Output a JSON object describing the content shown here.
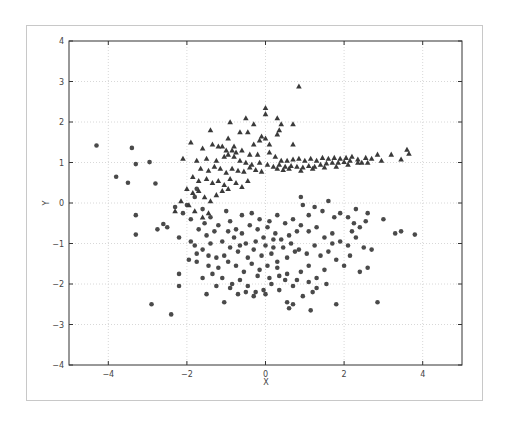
{
  "chart_data": {
    "type": "scatter",
    "title": "",
    "xlabel": "X",
    "ylabel": "Y",
    "xlim": [
      -5,
      5
    ],
    "ylim": [
      -4,
      4
    ],
    "xticks": [
      -4,
      -2,
      0,
      2,
      4
    ],
    "yticks": [
      -4,
      -3,
      -2,
      -1,
      0,
      1,
      2,
      3,
      4
    ],
    "grid": true,
    "legend": null,
    "colors": {
      "points": "#4a4a4a",
      "grid": "#d8d8d8",
      "axes": "#333333"
    },
    "series": [
      {
        "name": "class-circle",
        "marker": "circle",
        "points": [
          [
            -4.3,
            1.42
          ],
          [
            -3.4,
            1.36
          ],
          [
            -3.3,
            0.96
          ],
          [
            -2.95,
            1.01
          ],
          [
            -3.8,
            0.65
          ],
          [
            -3.5,
            0.5
          ],
          [
            -2.8,
            0.48
          ],
          [
            -3.3,
            -0.3
          ],
          [
            -3.3,
            -0.78
          ],
          [
            -2.6,
            -0.52
          ],
          [
            -2.5,
            -0.6
          ],
          [
            -2.2,
            -0.85
          ],
          [
            -2.75,
            -0.65
          ],
          [
            -2.2,
            -1.75
          ],
          [
            -2.2,
            -2.05
          ],
          [
            -2.9,
            -2.5
          ],
          [
            -2.4,
            -2.75
          ],
          [
            -1.5,
            -2.25
          ],
          [
            -1.05,
            -2.45
          ],
          [
            -2.3,
            -0.1
          ],
          [
            -2.1,
            -0.25
          ],
          [
            -2.0,
            -0.05
          ],
          [
            -1.8,
            0.15
          ],
          [
            -1.75,
            0.35
          ],
          [
            -1.6,
            -0.15
          ],
          [
            -1.4,
            -0.35
          ],
          [
            -1.9,
            -0.4
          ],
          [
            -1.7,
            -0.65
          ],
          [
            -1.55,
            -0.5
          ],
          [
            -1.3,
            -0.7
          ],
          [
            -1.2,
            -0.55
          ],
          [
            -1.0,
            -0.2
          ],
          [
            -0.9,
            -0.45
          ],
          [
            -0.75,
            -0.65
          ],
          [
            -0.6,
            -0.75
          ],
          [
            -0.4,
            -0.55
          ],
          [
            -0.2,
            -0.65
          ],
          [
            -0.05,
            -0.85
          ],
          [
            0.1,
            -0.45
          ],
          [
            -1.9,
            -0.95
          ],
          [
            -1.8,
            -1.05
          ],
          [
            -1.6,
            -1.15
          ],
          [
            -1.4,
            -1.0
          ],
          [
            -1.1,
            -0.95
          ],
          [
            -0.9,
            -1.1
          ],
          [
            -0.7,
            -1.2
          ],
          [
            -0.5,
            -1.0
          ],
          [
            -0.3,
            -1.15
          ],
          [
            -0.1,
            -1.3
          ],
          [
            0.2,
            -1.1
          ],
          [
            0.4,
            -0.9
          ],
          [
            0.6,
            -0.8
          ],
          [
            0.8,
            -0.7
          ],
          [
            -1.95,
            -1.4
          ],
          [
            -1.75,
            -1.45
          ],
          [
            -1.45,
            -1.55
          ],
          [
            -1.2,
            -1.6
          ],
          [
            -0.95,
            -1.45
          ],
          [
            -0.75,
            -1.55
          ],
          [
            -0.55,
            -1.7
          ],
          [
            -0.35,
            -1.5
          ],
          [
            -0.15,
            -1.65
          ],
          [
            0.05,
            -1.55
          ],
          [
            0.3,
            -1.45
          ],
          [
            0.55,
            -1.35
          ],
          [
            0.75,
            -1.2
          ],
          [
            -1.6,
            -1.85
          ],
          [
            -1.35,
            -1.75
          ],
          [
            -1.1,
            -1.85
          ],
          [
            -0.85,
            -2.0
          ],
          [
            -0.65,
            -1.9
          ],
          [
            -0.45,
            -2.05
          ],
          [
            -0.25,
            -2.2
          ],
          [
            -0.05,
            -2.15
          ],
          [
            0.15,
            -2.0
          ],
          [
            0.35,
            -1.8
          ],
          [
            0.55,
            -1.75
          ],
          [
            0.8,
            -1.9
          ],
          [
            -0.7,
            -2.25
          ],
          [
            -0.5,
            -2.2
          ],
          [
            -0.3,
            -2.3
          ],
          [
            0.0,
            -2.25
          ],
          [
            0.55,
            -2.45
          ],
          [
            0.6,
            -2.6
          ],
          [
            0.7,
            -2.5
          ],
          [
            1.15,
            -2.65
          ],
          [
            1.2,
            -2.2
          ],
          [
            1.8,
            -2.5
          ],
          [
            2.85,
            -2.45
          ],
          [
            0.9,
            0.15
          ],
          [
            0.95,
            -0.05
          ],
          [
            1.1,
            -0.3
          ],
          [
            1.25,
            -0.1
          ],
          [
            1.45,
            -0.2
          ],
          [
            1.6,
            0.05
          ],
          [
            1.75,
            -0.35
          ],
          [
            1.9,
            -0.25
          ],
          [
            2.1,
            -0.35
          ],
          [
            2.25,
            -0.5
          ],
          [
            2.4,
            -0.6
          ],
          [
            2.55,
            -0.45
          ],
          [
            2.3,
            -0.15
          ],
          [
            2.6,
            -0.25
          ],
          [
            3.0,
            -0.4
          ],
          [
            3.3,
            -0.75
          ],
          [
            3.45,
            -0.7
          ],
          [
            3.8,
            -0.78
          ],
          [
            0.3,
            -0.3
          ],
          [
            0.5,
            -0.5
          ],
          [
            0.7,
            -0.4
          ],
          [
            0.9,
            -0.55
          ],
          [
            1.1,
            -0.7
          ],
          [
            1.3,
            -0.6
          ],
          [
            1.5,
            -0.85
          ],
          [
            1.7,
            -0.75
          ],
          [
            1.9,
            -0.95
          ],
          [
            2.1,
            -1.05
          ],
          [
            2.3,
            -0.85
          ],
          [
            2.5,
            -1.1
          ],
          [
            2.7,
            -1.15
          ],
          [
            0.2,
            -0.9
          ],
          [
            0.45,
            -1.1
          ],
          [
            0.65,
            -1.0
          ],
          [
            0.85,
            -1.15
          ],
          [
            1.05,
            -1.25
          ],
          [
            1.25,
            -1.05
          ],
          [
            1.4,
            -1.3
          ],
          [
            1.6,
            -1.2
          ],
          [
            1.8,
            -1.4
          ],
          [
            2.0,
            -1.55
          ],
          [
            2.15,
            -1.3
          ],
          [
            2.4,
            -1.7
          ],
          [
            2.6,
            -1.6
          ],
          [
            0.3,
            -1.6
          ],
          [
            0.5,
            -1.9
          ],
          [
            0.7,
            -2.05
          ],
          [
            0.9,
            -1.7
          ],
          [
            1.1,
            -1.55
          ],
          [
            1.3,
            -1.85
          ],
          [
            1.5,
            -1.65
          ],
          [
            1.1,
            -1.95
          ],
          [
            1.3,
            -2.1
          ],
          [
            1.55,
            -2.0
          ],
          [
            0.95,
            -2.3
          ],
          [
            -0.6,
            -0.3
          ],
          [
            -0.35,
            -0.25
          ],
          [
            -0.15,
            -0.4
          ],
          [
            0.05,
            -0.6
          ],
          [
            0.25,
            -0.75
          ],
          [
            -0.8,
            -0.85
          ],
          [
            -1.05,
            -1.3
          ],
          [
            -1.25,
            -1.35
          ],
          [
            -0.45,
            -1.35
          ],
          [
            -0.25,
            -0.95
          ],
          [
            0.0,
            -1.05
          ],
          [
            0.15,
            -1.25
          ],
          [
            -1.5,
            -0.8
          ],
          [
            -1.75,
            -1.25
          ],
          [
            -0.95,
            -0.7
          ],
          [
            -0.65,
            -1.05
          ],
          [
            -0.2,
            -1.8
          ],
          [
            0.1,
            -1.85
          ],
          [
            0.35,
            -2.15
          ],
          [
            -0.9,
            -2.1
          ],
          [
            -1.25,
            -2.05
          ],
          [
            -1.45,
            -1.3
          ],
          [
            1.7,
            -1.0
          ],
          [
            2.2,
            -0.7
          ]
        ]
      },
      {
        "name": "class-triangle",
        "marker": "triangle",
        "points": [
          [
            0.85,
            2.88
          ],
          [
            0.0,
            2.35
          ],
          [
            0.0,
            2.2
          ],
          [
            -0.5,
            2.1
          ],
          [
            0.3,
            2.1
          ],
          [
            0.4,
            1.95
          ],
          [
            -0.9,
            2.0
          ],
          [
            -0.3,
            1.95
          ],
          [
            0.35,
            1.8
          ],
          [
            -1.4,
            1.8
          ],
          [
            -0.65,
            1.75
          ],
          [
            -0.45,
            1.75
          ],
          [
            0.3,
            1.7
          ],
          [
            -0.1,
            1.65
          ],
          [
            0.0,
            1.6
          ],
          [
            -0.15,
            1.55
          ],
          [
            -0.3,
            1.45
          ],
          [
            0.1,
            1.45
          ],
          [
            0.7,
            1.95
          ],
          [
            0.7,
            1.45
          ],
          [
            -1.9,
            1.5
          ],
          [
            -2.1,
            1.1
          ],
          [
            -1.35,
            1.45
          ],
          [
            -1.2,
            1.4
          ],
          [
            -1.6,
            1.35
          ],
          [
            -1.0,
            1.3
          ],
          [
            -0.85,
            1.3
          ],
          [
            -0.75,
            1.25
          ],
          [
            -0.6,
            1.3
          ],
          [
            -0.4,
            1.2
          ],
          [
            -0.2,
            1.2
          ],
          [
            0.1,
            1.25
          ],
          [
            0.25,
            1.15
          ],
          [
            -1.75,
            1.05
          ],
          [
            -1.5,
            1.1
          ],
          [
            -1.25,
            1.05
          ],
          [
            -1.05,
            1.15
          ],
          [
            -0.95,
            1.2
          ],
          [
            -0.8,
            1.15
          ],
          [
            -0.65,
            1.05
          ],
          [
            -0.5,
            1.0
          ],
          [
            -0.35,
            0.95
          ],
          [
            -0.15,
            1.0
          ],
          [
            0.05,
            0.95
          ],
          [
            0.2,
            0.9
          ],
          [
            0.35,
            0.95
          ],
          [
            0.5,
            0.9
          ],
          [
            0.65,
            0.92
          ],
          [
            0.8,
            0.9
          ],
          [
            0.95,
            0.88
          ],
          [
            1.1,
            0.92
          ],
          [
            1.25,
            0.9
          ],
          [
            1.4,
            0.95
          ],
          [
            1.55,
            0.98
          ],
          [
            1.7,
            1.0
          ],
          [
            1.85,
            1.0
          ],
          [
            2.0,
            1.02
          ],
          [
            2.15,
            1.05
          ],
          [
            0.4,
            1.05
          ],
          [
            0.55,
            1.05
          ],
          [
            0.7,
            1.08
          ],
          [
            0.85,
            1.1
          ],
          [
            1.0,
            1.05
          ],
          [
            1.15,
            1.1
          ],
          [
            1.3,
            1.05
          ],
          [
            1.45,
            1.12
          ],
          [
            1.6,
            1.1
          ],
          [
            1.75,
            1.12
          ],
          [
            1.9,
            1.1
          ],
          [
            2.05,
            1.12
          ],
          [
            2.2,
            1.15
          ],
          [
            2.35,
            1.08
          ],
          [
            0.3,
            0.85
          ],
          [
            0.45,
            0.82
          ],
          [
            0.6,
            0.85
          ],
          [
            0.9,
            0.8
          ],
          [
            1.2,
            0.85
          ],
          [
            1.5,
            0.88
          ],
          [
            1.8,
            0.9
          ],
          [
            2.1,
            0.95
          ],
          [
            2.35,
            1.0
          ],
          [
            2.6,
            1.0
          ],
          [
            2.7,
            1.1
          ],
          [
            2.85,
            1.2
          ],
          [
            2.95,
            1.05
          ],
          [
            3.2,
            1.2
          ],
          [
            3.45,
            1.08
          ],
          [
            3.6,
            1.32
          ],
          [
            3.65,
            1.22
          ],
          [
            2.45,
            1.0
          ],
          [
            2.55,
            1.12
          ],
          [
            -1.65,
            0.85
          ],
          [
            -1.45,
            0.8
          ],
          [
            -1.3,
            0.9
          ],
          [
            -1.15,
            0.85
          ],
          [
            -1.0,
            0.75
          ],
          [
            -0.85,
            0.85
          ],
          [
            -0.7,
            0.8
          ],
          [
            -0.55,
            0.78
          ],
          [
            -0.4,
            0.88
          ],
          [
            -0.25,
            0.82
          ],
          [
            -0.1,
            0.78
          ],
          [
            -1.85,
            0.65
          ],
          [
            -1.7,
            0.55
          ],
          [
            -1.5,
            0.6
          ],
          [
            -1.35,
            0.5
          ],
          [
            -1.2,
            0.55
          ],
          [
            -1.05,
            0.45
          ],
          [
            -0.9,
            0.6
          ],
          [
            -0.75,
            0.5
          ],
          [
            -0.6,
            0.4
          ],
          [
            -0.45,
            0.55
          ],
          [
            -2.0,
            0.35
          ],
          [
            -1.85,
            0.25
          ],
          [
            -1.7,
            0.3
          ],
          [
            -1.55,
            0.15
          ],
          [
            -1.4,
            0.05
          ],
          [
            -1.25,
            0.2
          ],
          [
            -2.15,
            0.05
          ],
          [
            -1.95,
            -0.05
          ],
          [
            -1.8,
            -0.2
          ],
          [
            -1.6,
            -0.35
          ],
          [
            -1.45,
            -0.25
          ],
          [
            -2.3,
            -0.2
          ],
          [
            -1.1,
            0.3
          ],
          [
            -0.95,
            0.35
          ],
          [
            -1.1,
            1.4
          ],
          [
            -0.95,
            1.6
          ],
          [
            -0.8,
            1.4
          ]
        ]
      }
    ]
  },
  "axes": {
    "xlabel": "X",
    "ylabel": "Y",
    "xtick_labels": [
      "−4",
      "−2",
      "0",
      "2",
      "4"
    ],
    "ytick_labels": [
      "−4",
      "−3",
      "−2",
      "−1",
      "0",
      "1",
      "2",
      "3",
      "4"
    ]
  }
}
